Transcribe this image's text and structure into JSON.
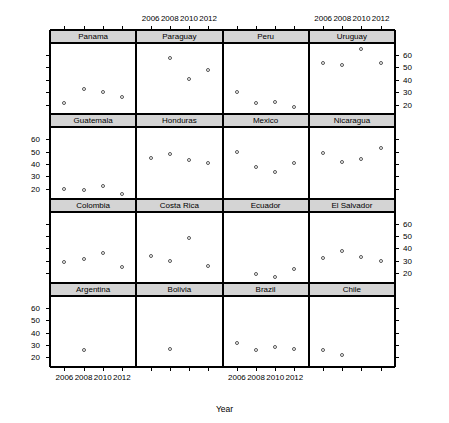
{
  "chart_data": {
    "type": "scatter",
    "title": "",
    "xlabel": "Year",
    "ylabel": "Percentage of Citizens Reporting a Party Identification",
    "layout": "trellis 4 rows x 4 columns, lattice/R style",
    "xlim": [
      2004.6,
      2013.4
    ],
    "ylim": [
      13,
      69
    ],
    "xticks": [
      2006,
      2008,
      2010,
      2012
    ],
    "xtick_labels": [
      "2006",
      "2008",
      "2010",
      "2012"
    ],
    "yticks": [
      20,
      30,
      40,
      50,
      60
    ],
    "ytick_labels": [
      "20",
      "30",
      "40",
      "50",
      "60"
    ],
    "grid": false,
    "legend": "none",
    "x_axis_label_position": "alternating: top for columns 2 and 4, bottom for columns 1 and 3",
    "y_axis_label_position": "alternating: right for rows 1 and 3, left for rows 2 and 4",
    "marker": "open circle",
    "panels": [
      {
        "name": "Panama",
        "row": 0,
        "col": 0,
        "x": [
          2006,
          2008,
          2010,
          2012
        ],
        "y": [
          21,
          33,
          30,
          26
        ]
      },
      {
        "name": "Paraguay",
        "row": 0,
        "col": 1,
        "x": [
          2008,
          2010,
          2012
        ],
        "y": [
          58,
          41,
          48
        ]
      },
      {
        "name": "Peru",
        "row": 0,
        "col": 2,
        "x": [
          2006,
          2008,
          2010,
          2012
        ],
        "y": [
          30,
          21,
          22,
          18
        ]
      },
      {
        "name": "Uruguay",
        "row": 0,
        "col": 3,
        "x": [
          2006,
          2008,
          2010,
          2012
        ],
        "y": [
          54,
          52,
          65,
          54
        ]
      },
      {
        "name": "Guatemala",
        "row": 1,
        "col": 0,
        "x": [
          2006,
          2008,
          2010,
          2012
        ],
        "y": [
          20,
          19,
          22,
          16
        ]
      },
      {
        "name": "Honduras",
        "row": 1,
        "col": 1,
        "x": [
          2006,
          2008,
          2010,
          2012
        ],
        "y": [
          45,
          48,
          43,
          41
        ]
      },
      {
        "name": "Mexico",
        "row": 1,
        "col": 2,
        "x": [
          2006,
          2008,
          2010,
          2012
        ],
        "y": [
          50,
          38,
          34,
          41
        ]
      },
      {
        "name": "Nicaragua",
        "row": 1,
        "col": 3,
        "x": [
          2006,
          2008,
          2010,
          2012
        ],
        "y": [
          49,
          42,
          44,
          53
        ]
      },
      {
        "name": "Colombia",
        "row": 2,
        "col": 0,
        "x": [
          2006,
          2008,
          2010,
          2012
        ],
        "y": [
          29,
          31,
          36,
          25
        ]
      },
      {
        "name": "Costa Rica",
        "row": 2,
        "col": 1,
        "x": [
          2006,
          2008,
          2010,
          2012
        ],
        "y": [
          34,
          30,
          48,
          26
        ]
      },
      {
        "name": "Ecuador",
        "row": 2,
        "col": 2,
        "x": [
          2008,
          2010,
          2012
        ],
        "y": [
          19,
          17,
          23
        ]
      },
      {
        "name": "El Salvador",
        "row": 2,
        "col": 3,
        "x": [
          2006,
          2008,
          2010,
          2012
        ],
        "y": [
          32,
          38,
          33,
          30
        ]
      },
      {
        "name": "Argentina",
        "row": 3,
        "col": 0,
        "x": [
          2008
        ],
        "y": [
          26
        ]
      },
      {
        "name": "Bolivia",
        "row": 3,
        "col": 1,
        "x": [
          2008
        ],
        "y": [
          27
        ]
      },
      {
        "name": "Brazil",
        "row": 3,
        "col": 2,
        "x": [
          2006,
          2008,
          2010,
          2012
        ],
        "y": [
          32,
          26,
          28,
          27
        ]
      },
      {
        "name": "Chile",
        "row": 3,
        "col": 3,
        "x": [
          2006,
          2008
        ],
        "y": [
          26,
          22
        ]
      }
    ]
  },
  "colors": {
    "strip_background": "#d4d4d4",
    "marker_stroke": "#555555",
    "axis": "#000000",
    "panel_background": "#ffffff"
  }
}
